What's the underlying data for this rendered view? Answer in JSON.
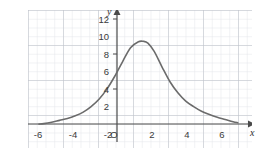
{
  "figure": {
    "kind": "coordinate-grid-graph",
    "background": "#ffffff",
    "grid": {
      "minor_color": "#e2e4ea",
      "major_color": "#b9bcc6",
      "minor_step_units": 0.5,
      "major_step_units": 2,
      "show": true
    },
    "axes": {
      "color": "#4a4a4a",
      "x_name": "x",
      "y_name": "y",
      "origin_label": "O",
      "x_arrow": true,
      "y_arrow": true
    },
    "curve": {
      "color": "#6b6b6b",
      "width_px": 1.6
    }
  },
  "chart_data": {
    "type": "line",
    "title": "",
    "subtitle": "",
    "xlabel": "x",
    "ylabel": "y",
    "grid": true,
    "legend": null,
    "xlim": [
      -7.0,
      7.2
    ],
    "ylim": [
      -1.6,
      13.4
    ],
    "xticks": [
      -6,
      -4,
      -2,
      0,
      2,
      4,
      6
    ],
    "xticklabels": [
      "-6",
      "-4",
      "-2",
      "O",
      "2",
      "4",
      "6"
    ],
    "yticks": [
      2,
      4,
      6,
      8,
      10,
      12
    ],
    "yticklabels": [
      "2",
      "4",
      "6",
      "8",
      "10",
      "12"
    ],
    "annotations": [],
    "series": [
      {
        "name": "curve",
        "peak": {
          "x": 0.3,
          "y": 10.0
        },
        "x": [
          -6.3,
          -6.0,
          -5.5,
          -5.0,
          -4.5,
          -4.0,
          -3.5,
          -3.0,
          -2.5,
          -2.0,
          -1.5,
          -1.0,
          -0.5,
          0.0,
          0.3,
          0.6,
          1.0,
          1.5,
          2.0,
          2.5,
          3.0,
          3.5,
          4.0,
          4.5,
          5.0,
          5.5,
          6.0,
          6.3
        ],
        "y": [
          1.0,
          1.05,
          1.2,
          1.4,
          1.6,
          1.9,
          2.3,
          2.9,
          3.7,
          4.8,
          6.2,
          7.8,
          9.3,
          9.95,
          10.0,
          9.8,
          8.9,
          7.2,
          5.6,
          4.4,
          3.5,
          2.9,
          2.4,
          2.05,
          1.75,
          1.5,
          1.25,
          1.15
        ]
      }
    ]
  }
}
